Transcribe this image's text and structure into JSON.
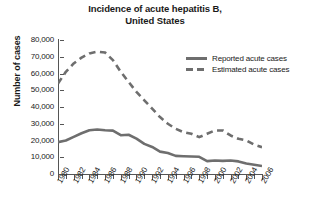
{
  "chart_data": {
    "type": "line",
    "title": "Incidence of acute hepatitis B, United States",
    "title_line1": "Incidence of acute hepatitis B,",
    "title_line2": "United States",
    "xlabel": "",
    "ylabel": "Number of cases",
    "xlim": [
      1980,
      2006
    ],
    "ylim": [
      0,
      80000
    ],
    "ytick_values": [
      0,
      10000,
      20000,
      30000,
      40000,
      50000,
      60000,
      70000,
      80000
    ],
    "ytick_labels": [
      "0",
      "10,000",
      "20,000",
      "30,000",
      "40,000",
      "50,000",
      "60,000",
      "70,000",
      "80,000"
    ],
    "xtick_values": [
      1980,
      1982,
      1984,
      1986,
      1988,
      1990,
      1992,
      1994,
      1996,
      1998,
      2000,
      2002,
      2004,
      2006
    ],
    "xtick_labels": [
      "1980",
      "1982",
      "1984",
      "1986",
      "1988",
      "1990",
      "1992",
      "1994",
      "1996",
      "1998",
      "2000",
      "2002",
      "2004",
      "2006"
    ],
    "minor_xticks_every": 1,
    "grid": false,
    "legend_position": "upper right",
    "line_color": "#6e6e6e",
    "x": [
      1980,
      1981,
      1982,
      1983,
      1984,
      1985,
      1986,
      1987,
      1988,
      1989,
      1990,
      1991,
      1992,
      1993,
      1994,
      1995,
      1996,
      1997,
      1998,
      1999,
      2000,
      2001,
      2002,
      2003,
      2004,
      2005,
      2006
    ],
    "series": [
      {
        "name": "Reported acute cases",
        "style": "solid",
        "color": "#6e6e6e",
        "values": [
          19015,
          20000,
          22177,
          24318,
          26115,
          26611,
          26107,
          25916,
          23177,
          23419,
          21102,
          18003,
          16126,
          13361,
          12517,
          10805,
          10637,
          10416,
          10258,
          7694,
          8036,
          7844,
          8064,
          7526,
          6212,
          5494,
          4758
        ]
      },
      {
        "name": "Estimated acute cases",
        "style": "dashed",
        "color": "#6e6e6e",
        "values": [
          54000,
          61000,
          66000,
          69500,
          72000,
          73000,
          72500,
          68000,
          61000,
          55000,
          49000,
          44000,
          39000,
          34000,
          30000,
          27000,
          25000,
          24000,
          22000,
          24000,
          26000,
          26000,
          23000,
          21000,
          20000,
          17500,
          16000
        ]
      }
    ],
    "legend": [
      {
        "label": "Reported acute cases",
        "style": "solid"
      },
      {
        "label": "Estimated acute cases",
        "style": "dashed"
      }
    ]
  }
}
